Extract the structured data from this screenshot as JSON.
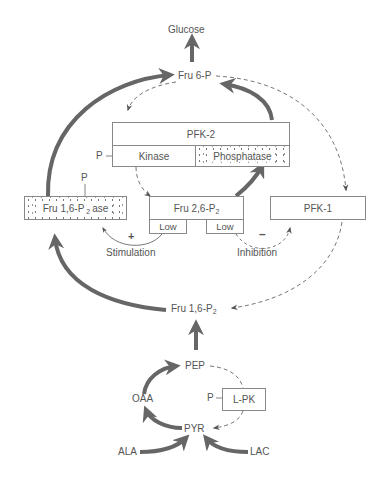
{
  "diagram": {
    "type": "metabolic-pathway",
    "colors": {
      "solid_arrow": "#666666",
      "dashed_arrow": "#777777",
      "box_border": "#888888",
      "text": "#555555"
    },
    "metabolites": {
      "glucose": "Glucose",
      "fru6p": "Fru 6-P",
      "fru16p2": {
        "base": "Fru 1,6-P",
        "sub": "2"
      },
      "pep": "PEP",
      "oaa": "OAA",
      "pyr": "PYR",
      "ala": "ALA",
      "lac": "LAC"
    },
    "enzymes": {
      "pfk2": {
        "title": "PFK-2",
        "kinase": "Kinase",
        "phosphatase": "Phosphatase",
        "phospho": "P"
      },
      "fbpase": {
        "base": "Fru 1,6-P",
        "sub": "2",
        "suffix": "ase",
        "phospho": "P"
      },
      "fru26p2": {
        "base": "Fru 2,6-P",
        "sub": "2",
        "low_left": "Low",
        "low_right": "Low"
      },
      "pfk1": "PFK-1",
      "lpk": {
        "label": "L-PK",
        "phospho": "P"
      }
    },
    "regulation": {
      "stimulation": "Stimulation",
      "stimulation_sign": "+",
      "inhibition": "Inhibition",
      "inhibition_sign": "–"
    }
  }
}
